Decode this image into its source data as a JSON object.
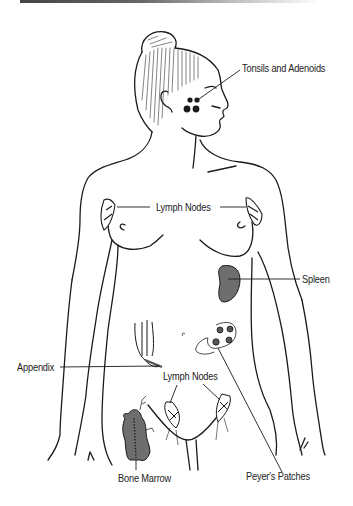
{
  "diagram": {
    "labels": {
      "tonsils": "Tonsils and Adenoids",
      "lymph_nodes_upper": "Lymph Nodes",
      "spleen": "Spleen",
      "appendix": "Appendix",
      "lymph_nodes_lower": "Lymph Nodes",
      "bone_marrow": "Bone Marrow",
      "peyers_patches": "Peyer's Patches"
    },
    "colors": {
      "line": "#1a1a1a",
      "organ_fill": "#6e6e6e",
      "background": "#ffffff"
    }
  }
}
